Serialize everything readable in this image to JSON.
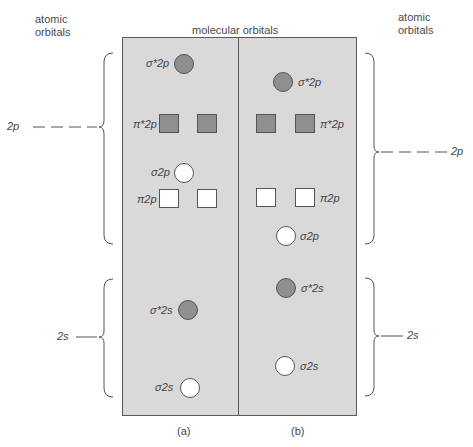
{
  "headers": {
    "left": [
      "atomic",
      "orbitals"
    ],
    "center": "molecular orbitals",
    "right": [
      "atomic",
      "orbitals"
    ]
  },
  "atomic_levels": {
    "left": {
      "p": "2p",
      "s": "2s"
    },
    "right": {
      "p": "2p",
      "s": "2s"
    }
  },
  "panels": [
    {
      "caption": "(a)",
      "orbitals": [
        {
          "label": "σ*2p",
          "shape": "circle",
          "fill": "filled"
        },
        {
          "label": "π*2p",
          "shape": "square-pair",
          "fill": "filled"
        },
        {
          "label": "σ2p",
          "shape": "circle",
          "fill": "empty"
        },
        {
          "label": "π2p",
          "shape": "square-pair",
          "fill": "empty"
        },
        {
          "label": "σ*2s",
          "shape": "circle",
          "fill": "filled"
        },
        {
          "label": "σ2s",
          "shape": "circle",
          "fill": "empty"
        }
      ]
    },
    {
      "caption": "(b)",
      "orbitals": [
        {
          "label": "σ*2p",
          "shape": "circle",
          "fill": "filled"
        },
        {
          "label": "π*2p",
          "shape": "square-pair",
          "fill": "filled"
        },
        {
          "label": "π2p",
          "shape": "square-pair",
          "fill": "empty"
        },
        {
          "label": "σ2p",
          "shape": "circle",
          "fill": "empty"
        },
        {
          "label": "σ*2s",
          "shape": "circle",
          "fill": "filled"
        },
        {
          "label": "σ2s",
          "shape": "circle",
          "fill": "empty"
        }
      ]
    }
  ],
  "colors": {
    "panel_fill": "#d9d9d9",
    "filled_orbital": "#8f8f8f",
    "empty_orbital": "#ffffff",
    "outline": "#555555"
  }
}
